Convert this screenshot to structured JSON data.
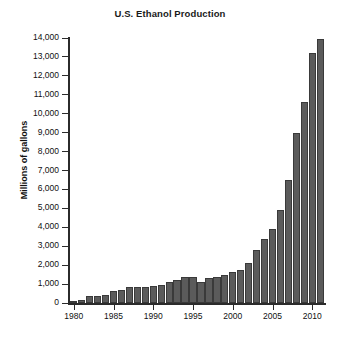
{
  "chart_data": {
    "type": "bar",
    "title": "U.S. Ethanol Production",
    "xlabel": "",
    "ylabel": "Millions of gallons",
    "xlim": [
      1979.4,
      2011.6
    ],
    "ylim": [
      0,
      14000
    ],
    "grid": false,
    "legend": false,
    "bar_color": "#5b5b5b",
    "bar_edge_color": "#3a3a3a",
    "axis_color": "#2b2b2b",
    "background_color": "#ffffff",
    "y_ticks": [
      0,
      1000,
      2000,
      3000,
      4000,
      5000,
      6000,
      7000,
      8000,
      9000,
      10000,
      11000,
      12000,
      13000,
      14000
    ],
    "y_tick_labels": [
      "0",
      "1,000",
      "2,000",
      "3,000",
      "4,000",
      "5,000",
      "6,000",
      "7,000",
      "8,000",
      "9,000",
      "10,000",
      "11,000",
      "12,000",
      "13,000",
      "14,000"
    ],
    "x_ticks": [
      1980,
      1985,
      1990,
      1995,
      2000,
      2005,
      2010
    ],
    "x_tick_labels": [
      "1980",
      "1985",
      "1990",
      "1995",
      "2000",
      "2005",
      "2010"
    ],
    "categories": [
      1980,
      1981,
      1982,
      1983,
      1984,
      1985,
      1986,
      1987,
      1988,
      1989,
      1990,
      1991,
      1992,
      1993,
      1994,
      1995,
      1996,
      1997,
      1998,
      1999,
      2000,
      2001,
      2002,
      2003,
      2004,
      2005,
      2006,
      2007,
      2008,
      2009,
      2010,
      2011
    ],
    "values": [
      120,
      150,
      350,
      375,
      430,
      610,
      710,
      830,
      845,
      870,
      900,
      950,
      1100,
      1200,
      1350,
      1400,
      1100,
      1300,
      1400,
      1470,
      1630,
      1770,
      2130,
      2800,
      3400,
      3900,
      4900,
      6500,
      9000,
      10600,
      13230,
      13950
    ],
    "series": [
      {
        "name": "U.S. ethanol production",
        "units": "millions of gallons",
        "values": [
          120,
          150,
          350,
          375,
          430,
          610,
          710,
          830,
          845,
          870,
          900,
          950,
          1100,
          1200,
          1350,
          1400,
          1100,
          1300,
          1400,
          1470,
          1630,
          1770,
          2130,
          2800,
          3400,
          3900,
          4900,
          6500,
          9000,
          10600,
          13230,
          13950
        ]
      }
    ],
    "annotations": []
  }
}
